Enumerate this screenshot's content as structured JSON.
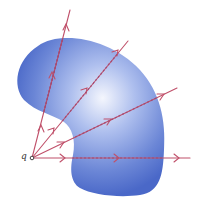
{
  "figure": {
    "charge_label": "q",
    "colors": {
      "surface_light": "#eef2fc",
      "surface_mid": "#8ea6e3",
      "surface_dark": "#4a68c8",
      "field_line": "#c0506a",
      "charge_dot": "#444444"
    },
    "field_lines": [
      {
        "name": "field-line-1",
        "from": [
          32,
          158
        ],
        "to": [
          70,
          10
        ]
      },
      {
        "name": "field-line-2",
        "from": [
          32,
          158
        ],
        "to": [
          128,
          41
        ]
      },
      {
        "name": "field-line-3",
        "from": [
          32,
          158
        ],
        "to": [
          177,
          88
        ]
      },
      {
        "name": "field-line-4",
        "from": [
          32,
          158
        ],
        "to": [
          190,
          158
        ]
      }
    ]
  }
}
